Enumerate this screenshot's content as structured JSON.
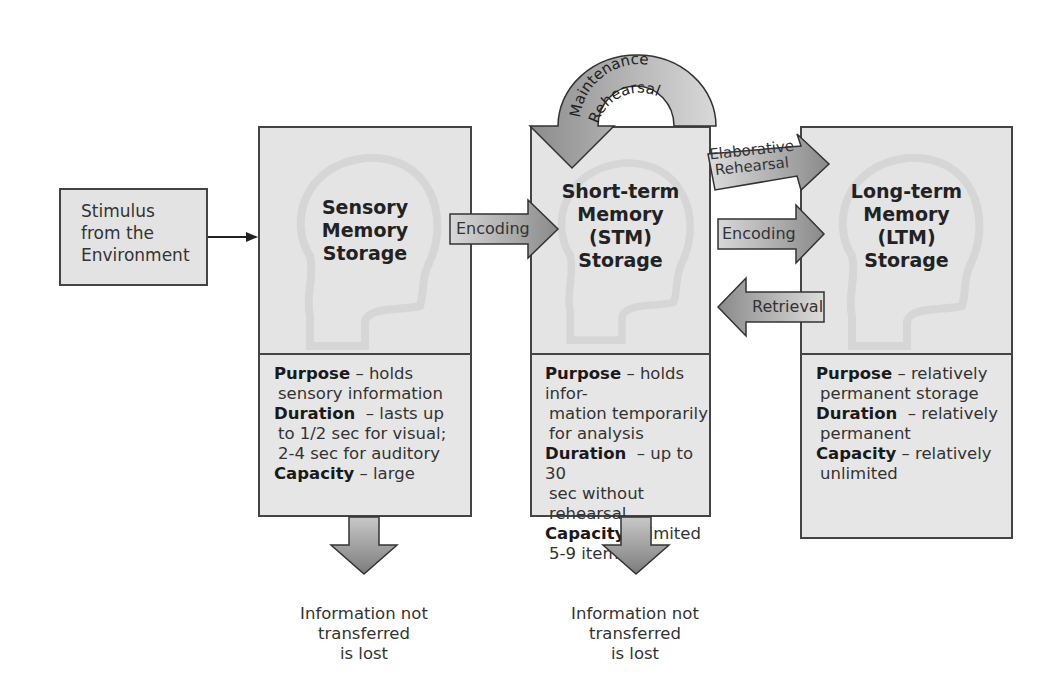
{
  "stimulus": {
    "lines": [
      "Stimulus",
      "from the",
      "Environment"
    ]
  },
  "stores": [
    {
      "id": "sensory",
      "title": [
        "Sensory",
        "Memory",
        "Storage"
      ],
      "purpose_label": "Purpose",
      "purpose_text": [
        "– holds",
        "sensory information"
      ],
      "duration_label": "Duration",
      "duration_text": [
        "– lasts up",
        "to 1/2 sec for visual;",
        "2-4 sec for auditory"
      ],
      "capacity_label": "Capacity",
      "capacity_text": [
        "– large"
      ]
    },
    {
      "id": "stm",
      "title": [
        "Short-term",
        "Memory",
        "(STM)",
        "Storage"
      ],
      "purpose_label": "Purpose",
      "purpose_text": [
        "– holds infor-",
        "mation temporarily",
        "for analysis"
      ],
      "duration_label": "Duration",
      "duration_text": [
        "– up to 30",
        "sec without rehearsal"
      ],
      "capacity_label": "Capacity",
      "capacity_text": [
        "– limited",
        "5-9 items"
      ]
    },
    {
      "id": "ltm",
      "title": [
        "Long-term",
        "Memory",
        "(LTM)",
        "Storage"
      ],
      "purpose_label": "Purpose",
      "purpose_text": [
        "– relatively",
        "permanent storage"
      ],
      "duration_label": "Duration",
      "duration_text": [
        "– relatively",
        "permanent"
      ],
      "capacity_label": "Capacity",
      "capacity_text": [
        "– relatively",
        "unlimited"
      ]
    }
  ],
  "arrows": {
    "encoding1": "Encoding",
    "encoding2": "Encoding",
    "retrieval": "Retrieval",
    "elaborative": [
      "Elaborative",
      "Rehearsal"
    ],
    "maintenance": [
      "Maintenance",
      "Rehearsal"
    ]
  },
  "lost": {
    "sensory": [
      "Information not",
      "transferred",
      "is lost"
    ],
    "stm": [
      "Information not",
      "transferred",
      "is lost"
    ]
  },
  "colors": {
    "box_fill": "#e6e6e6",
    "border": "#444444",
    "arrow_dark": "#8a8a8a",
    "arrow_light": "#d8d8d8"
  }
}
